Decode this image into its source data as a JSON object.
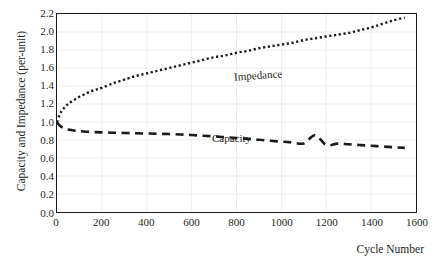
{
  "figure": {
    "top_clipped_text": "",
    "background": "#ffffff",
    "axis_color": "#1b1b1b",
    "grid_color": "#ededed",
    "text_color": "#231f20"
  },
  "chart_data": {
    "type": "line",
    "title": "",
    "xlabel": "Cycle Number",
    "ylabel": "Capacity and Impedance (per-unit)",
    "xlim": [
      0,
      1600
    ],
    "ylim": [
      0.0,
      2.2
    ],
    "xticks": [
      0,
      200,
      400,
      600,
      800,
      1000,
      1200,
      1400,
      1600
    ],
    "xtick_labels": [
      "0",
      "200",
      "400",
      "600",
      "800",
      "1000",
      "1200",
      "1400",
      "1600"
    ],
    "yticks": [
      0.0,
      0.2,
      0.4,
      0.6,
      0.8,
      1.0,
      1.2,
      1.4,
      1.6,
      1.8,
      2.0,
      2.2
    ],
    "ytick_labels": [
      "0.0",
      "0.2",
      "0.4",
      "0.6",
      "0.8",
      "1.0",
      "1.2",
      "1.4",
      "1.6",
      "1.8",
      "2.0",
      "2.2"
    ],
    "grid": true,
    "grid_axes": "both",
    "legend": "inline-annotations",
    "legend_position": "inside-plot",
    "annotations": [
      {
        "text": "Impedance",
        "x": 690,
        "y": 1.74
      },
      {
        "text": "Capacity",
        "x": 470,
        "y": 1.02
      }
    ],
    "series": [
      {
        "name": "Impedance",
        "style": "dotted",
        "color": "#1b1b1b",
        "linewidth": 2.4,
        "x": [
          0,
          10,
          20,
          30,
          40,
          50,
          60,
          80,
          100,
          125,
          150,
          175,
          200,
          250,
          300,
          350,
          400,
          450,
          500,
          550,
          600,
          650,
          700,
          750,
          800,
          850,
          900,
          950,
          1000,
          1050,
          1100,
          1150,
          1200,
          1250,
          1300,
          1350,
          1400,
          1450,
          1500,
          1550
        ],
        "y": [
          1.0,
          1.07,
          1.12,
          1.15,
          1.18,
          1.2,
          1.22,
          1.25,
          1.28,
          1.31,
          1.34,
          1.36,
          1.38,
          1.43,
          1.47,
          1.51,
          1.54,
          1.57,
          1.6,
          1.63,
          1.66,
          1.69,
          1.72,
          1.74,
          1.77,
          1.79,
          1.82,
          1.84,
          1.86,
          1.88,
          1.91,
          1.93,
          1.95,
          1.97,
          1.99,
          2.02,
          2.05,
          2.09,
          2.13,
          2.16
        ]
      },
      {
        "name": "Capacity",
        "style": "dashed",
        "color": "#1b1b1b",
        "linewidth": 2.6,
        "x": [
          0,
          10,
          20,
          30,
          40,
          50,
          75,
          100,
          150,
          200,
          250,
          300,
          350,
          400,
          450,
          500,
          550,
          600,
          650,
          700,
          750,
          800,
          850,
          900,
          950,
          1000,
          1050,
          1100,
          1150,
          1200,
          1250,
          1300,
          1350,
          1400,
          1450,
          1500,
          1550
        ],
        "y": [
          1.0,
          0.965,
          0.945,
          0.932,
          0.923,
          0.916,
          0.905,
          0.898,
          0.89,
          0.885,
          0.881,
          0.878,
          0.875,
          0.872,
          0.869,
          0.866,
          0.861,
          0.855,
          0.848,
          0.84,
          0.831,
          0.822,
          0.812,
          0.802,
          0.792,
          0.782,
          0.772,
          0.762,
          0.853,
          0.745,
          0.76,
          0.752,
          0.744,
          0.736,
          0.728,
          0.72,
          0.712
        ]
      }
    ]
  }
}
